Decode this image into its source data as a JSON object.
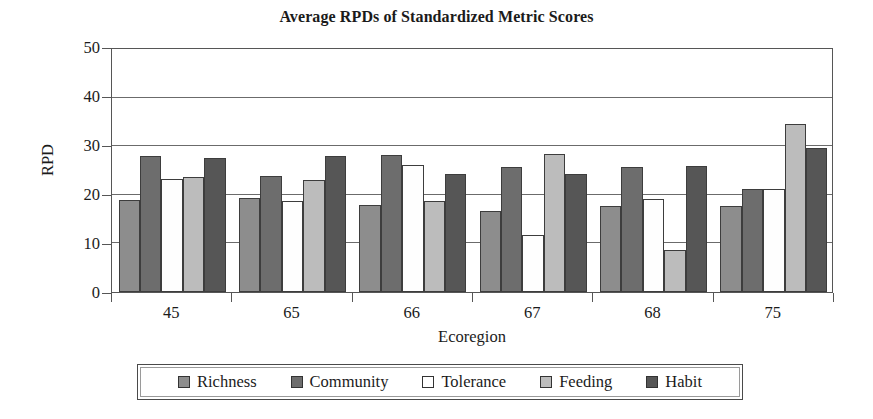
{
  "chart_data": {
    "type": "bar",
    "title": "Average RPDs of Standardized Metric Scores",
    "xlabel": "Ecoregion",
    "ylabel": "RPD",
    "ylim": [
      0,
      50
    ],
    "yticks": [
      0,
      10,
      20,
      30,
      40,
      50
    ],
    "grid": true,
    "legend_position": "bottom",
    "categories": [
      "45",
      "65",
      "66",
      "67",
      "68",
      "75"
    ],
    "series": [
      {
        "name": "Richness",
        "color": "#8d8d8d",
        "values": [
          19.0,
          19.3,
          18.0,
          16.6,
          17.6,
          17.6
        ]
      },
      {
        "name": "Community",
        "color": "#6d6d6d",
        "values": [
          27.9,
          23.9,
          28.1,
          25.7,
          25.8,
          21.1
        ]
      },
      {
        "name": "Tolerance",
        "color": "#ffffff",
        "values": [
          23.3,
          18.8,
          26.1,
          11.8,
          19.2,
          21.1
        ]
      },
      {
        "name": "Feeding",
        "color": "#bcbcbc",
        "values": [
          23.7,
          23.0,
          18.8,
          28.3,
          8.7,
          34.5
        ]
      },
      {
        "name": "Habit",
        "color": "#565656",
        "values": [
          27.5,
          28.0,
          24.2,
          24.3,
          25.9,
          29.7
        ]
      }
    ]
  },
  "legend": {
    "items": [
      {
        "label": "Richness",
        "swatch": "#8d8d8d"
      },
      {
        "label": "Community",
        "swatch": "#6d6d6d"
      },
      {
        "label": "Tolerance",
        "swatch": "#ffffff"
      },
      {
        "label": "Feeding",
        "swatch": "#bcbcbc"
      },
      {
        "label": "Habit",
        "swatch": "#565656"
      }
    ]
  }
}
